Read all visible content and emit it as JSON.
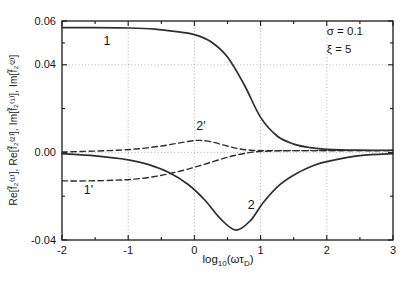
{
  "chart_data": {
    "type": "line",
    "title": "",
    "ylabel": "Re[f̃₂⁽¹⁾], Re[f̃₂⁽²⁾], Im[f̃₂⁽¹⁾], Im[f̃₂⁽²⁾]",
    "xlabel_parts": {
      "base1": "log",
      "sub1": "10",
      "base2": "(ωτ",
      "sub2": "D",
      "base3": ")"
    },
    "xlim": [
      -2,
      3
    ],
    "ylim": [
      -0.04,
      0.06
    ],
    "x_tick_labels": [
      {
        "value": -2,
        "label": "-2"
      },
      {
        "value": -1,
        "label": "-1"
      },
      {
        "value": 0,
        "label": "0"
      },
      {
        "value": 1,
        "label": "1"
      },
      {
        "value": 2,
        "label": "2"
      },
      {
        "value": 3,
        "label": "3"
      }
    ],
    "x_minor_ticks": [
      -1.5,
      -0.5,
      0.5,
      1.5,
      2.5
    ],
    "y_tick_labels": [
      {
        "value": 0.06,
        "label": "0.06"
      },
      {
        "value": 0.04,
        "label": "0.04"
      },
      {
        "value": 0.0,
        "label": "0.00"
      },
      {
        "value": -0.04,
        "label": "-0.04"
      }
    ],
    "y_minor_ticks": [
      0.05,
      0.02,
      -0.02
    ],
    "x_gridlines": [
      -1,
      0,
      1,
      2
    ],
    "y_gridlines": [
      0.04,
      0.0
    ],
    "grid_on": true,
    "grid_style": "dotted",
    "legend": "none",
    "frame_color": "#1a1a1a",
    "line_color": "#2e2e2e",
    "grid_color": "#a8a8a8",
    "annotations": [
      {
        "text": "σ = 0.1",
        "x": 2.0,
        "y": 0.0535
      },
      {
        "text": "ξ = 5",
        "x": 2.0,
        "y": 0.0452
      }
    ],
    "curve_labels": [
      {
        "text": "1",
        "x": -1.32,
        "y": 0.0492
      },
      {
        "text": "2'",
        "x": 0.1,
        "y": 0.0102
      },
      {
        "text": "1'",
        "x": -1.6,
        "y": -0.0188
      },
      {
        "text": "2",
        "x": 0.86,
        "y": -0.0258
      }
    ],
    "series": [
      {
        "name": "1",
        "style": "solid",
        "points": [
          [
            -2,
            0.057
          ],
          [
            -1.5,
            0.057
          ],
          [
            -1,
            0.0568
          ],
          [
            -0.6,
            0.0563
          ],
          [
            -0.3,
            0.0553
          ],
          [
            0,
            0.0538
          ],
          [
            0.25,
            0.0505
          ],
          [
            0.5,
            0.0435
          ],
          [
            0.75,
            0.031
          ],
          [
            1,
            0.016
          ],
          [
            1.25,
            0.0075
          ],
          [
            1.5,
            0.0038
          ],
          [
            1.75,
            0.0022
          ],
          [
            2,
            0.0014
          ],
          [
            2.5,
            0.001
          ],
          [
            3,
            0.001
          ]
        ]
      },
      {
        "name": "2",
        "style": "solid",
        "points": [
          [
            -2,
            -0.0006
          ],
          [
            -1.5,
            -0.0016
          ],
          [
            -1,
            -0.0034
          ],
          [
            -0.7,
            -0.0055
          ],
          [
            -0.4,
            -0.009
          ],
          [
            -0.1,
            -0.0145
          ],
          [
            0.15,
            -0.0215
          ],
          [
            0.4,
            -0.0305
          ],
          [
            0.63,
            -0.0355
          ],
          [
            0.85,
            -0.031
          ],
          [
            1.05,
            -0.0225
          ],
          [
            1.3,
            -0.0145
          ],
          [
            1.55,
            -0.0095
          ],
          [
            1.8,
            -0.006
          ],
          [
            2,
            -0.0042
          ],
          [
            2.5,
            -0.0015
          ],
          [
            3,
            -0.0006
          ]
        ]
      },
      {
        "name": "1'",
        "style": "dashed",
        "points": [
          [
            -2,
            -0.013
          ],
          [
            -1.6,
            -0.013
          ],
          [
            -1.2,
            -0.0127
          ],
          [
            -0.9,
            -0.0122
          ],
          [
            -0.6,
            -0.011
          ],
          [
            -0.3,
            -0.0092
          ],
          [
            0,
            -0.0068
          ],
          [
            0.25,
            -0.0045
          ],
          [
            0.5,
            -0.0022
          ],
          [
            0.7,
            -0.0008
          ],
          [
            0.9,
            0.0002
          ],
          [
            1.2,
            0.0007
          ],
          [
            1.6,
            0.0008
          ],
          [
            2,
            0.0008
          ],
          [
            2.5,
            0.0008
          ],
          [
            3,
            0.0008
          ]
        ]
      },
      {
        "name": "2'",
        "style": "dashed",
        "points": [
          [
            -2,
            0.0002
          ],
          [
            -1.5,
            0.0006
          ],
          [
            -1.1,
            0.0011
          ],
          [
            -0.8,
            0.0018
          ],
          [
            -0.5,
            0.0029
          ],
          [
            -0.25,
            0.0042
          ],
          [
            -0.05,
            0.0052
          ],
          [
            0.08,
            0.0055
          ],
          [
            0.25,
            0.0049
          ],
          [
            0.45,
            0.0033
          ],
          [
            0.65,
            0.0018
          ],
          [
            0.85,
            0.001
          ],
          [
            1.1,
            0.0008
          ],
          [
            1.5,
            0.0008
          ],
          [
            2,
            0.0008
          ],
          [
            2.5,
            0.0008
          ],
          [
            3,
            0.0008
          ]
        ]
      }
    ]
  }
}
